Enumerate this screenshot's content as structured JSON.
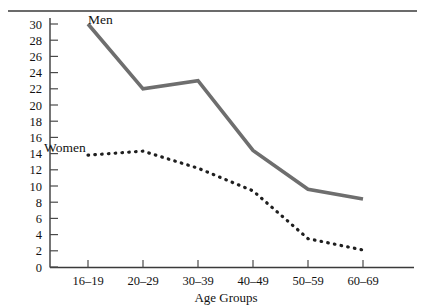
{
  "chart_data": {
    "type": "line",
    "title": "",
    "xlabel": "Age Groups",
    "ylabel": "",
    "categories": [
      "16–19",
      "20–29",
      "30–39",
      "40–49",
      "50–59",
      "60–69"
    ],
    "ylim": [
      0,
      30
    ],
    "y_ticks": [
      0,
      2,
      4,
      6,
      8,
      10,
      12,
      14,
      16,
      18,
      20,
      22,
      24,
      26,
      28,
      30
    ],
    "grid": false,
    "legend_position": "inline-annotations",
    "series": [
      {
        "name": "Men",
        "style": "solid",
        "color": "#6e6e6e",
        "values": [
          30.0,
          22.0,
          23.0,
          14.4,
          9.6,
          8.4
        ]
      },
      {
        "name": "Women",
        "style": "dotted",
        "color": "#1f1f1f",
        "values": [
          13.8,
          14.3,
          12.2,
          9.4,
          3.5,
          2.1
        ]
      }
    ],
    "annotations": [
      {
        "text": "Men",
        "series": "Men"
      },
      {
        "text": "Women",
        "series": "Women"
      }
    ]
  },
  "axes": {
    "y_tick_labels": [
      "30",
      "28",
      "26",
      "24",
      "22",
      "20",
      "18",
      "16",
      "14",
      "12",
      "10",
      "8",
      "6",
      "4",
      "2",
      "0"
    ],
    "x_tick_labels": [
      "16–19",
      "20–29",
      "30–39",
      "40–49",
      "50–59",
      "60–69"
    ],
    "x_axis_title": "Age Groups"
  },
  "labels": {
    "men": "Men",
    "women": "Women"
  },
  "colors": {
    "men_line": "#6e6e6e",
    "women_line": "#1f1f1f",
    "axis": "#3a3a3a",
    "text": "#121212",
    "background": "#ffffff"
  }
}
